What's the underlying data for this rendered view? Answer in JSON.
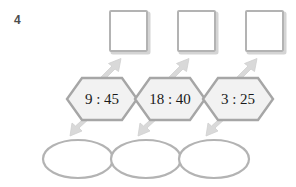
{
  "worksheet": {
    "exercise_number": "4",
    "background_color": "#ffffff"
  },
  "colors": {
    "shape_stroke": "#b3b3b3",
    "hex_stroke": "#a6a6a6",
    "hex_fill": "#f2f2f2",
    "arrow_fill": "#d9d9d9",
    "arrow_stroke": "#cccccc",
    "text": "#1a1a1a",
    "number_label": "#4d4d4d",
    "box_shadow": "#d4d4d4"
  },
  "answer_boxes": [
    {
      "name": "answer-box-1",
      "value": ""
    },
    {
      "name": "answer-box-2",
      "value": ""
    },
    {
      "name": "answer-box-3",
      "value": ""
    }
  ],
  "hexagons": [
    {
      "name": "hexagon-time-1",
      "value": "9 : 45"
    },
    {
      "name": "hexagon-time-2",
      "value": "18 : 40"
    },
    {
      "name": "hexagon-time-3",
      "value": "3 : 25"
    }
  ],
  "answer_ellipses": [
    {
      "name": "answer-ellipse-1",
      "value": ""
    },
    {
      "name": "answer-ellipse-2",
      "value": ""
    },
    {
      "name": "answer-ellipse-3",
      "value": ""
    }
  ],
  "arrows_up": [
    {
      "name": "arrow-up-1"
    },
    {
      "name": "arrow-up-2"
    },
    {
      "name": "arrow-up-3"
    }
  ],
  "arrows_down": [
    {
      "name": "arrow-down-1"
    },
    {
      "name": "arrow-down-2"
    },
    {
      "name": "arrow-down-3"
    }
  ]
}
